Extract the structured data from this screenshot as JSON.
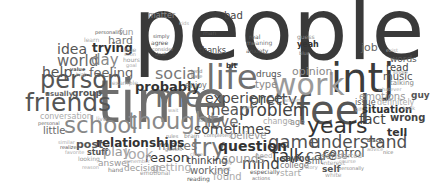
{
  "words": [
    {
      "text": "people",
      "x": 133,
      "y": -14,
      "size": 86,
      "color": "#3a3a3a",
      "weight": "normal"
    },
    {
      "text": "time",
      "x": 97,
      "y": 73,
      "size": 58,
      "color": "#6e6e6e",
      "weight": "normal"
    },
    {
      "text": "intj",
      "x": 331,
      "y": 58,
      "size": 40,
      "color": "#3c3c3c",
      "weight": "normal"
    },
    {
      "text": "feel",
      "x": 296,
      "y": 90,
      "size": 40,
      "color": "#555555",
      "weight": "normal"
    },
    {
      "text": "life",
      "x": 206,
      "y": 60,
      "size": 34,
      "color": "#707070",
      "weight": "normal"
    },
    {
      "text": "work",
      "x": 272,
      "y": 70,
      "size": 30,
      "color": "#9a9a9a",
      "weight": "normal"
    },
    {
      "text": "person",
      "x": 40,
      "y": 68,
      "size": 24,
      "color": "#555555",
      "weight": "normal"
    },
    {
      "text": "friends",
      "x": 25,
      "y": 90,
      "size": 25,
      "color": "#555555",
      "weight": "normal"
    },
    {
      "text": "school",
      "x": 64,
      "y": 114,
      "size": 23,
      "color": "#888888",
      "weight": "normal"
    },
    {
      "text": "thought",
      "x": 128,
      "y": 110,
      "size": 23,
      "color": "#8a8a8a",
      "weight": "normal"
    },
    {
      "text": "years",
      "x": 307,
      "y": 115,
      "size": 22,
      "color": "#333333",
      "weight": "normal"
    },
    {
      "text": "understand",
      "x": 310,
      "y": 134,
      "size": 17,
      "color": "#505050",
      "weight": "normal"
    },
    {
      "text": "me",
      "x": 155,
      "y": 82,
      "size": 30,
      "color": "#6e6e6e",
      "weight": "normal"
    },
    {
      "text": "game",
      "x": 268,
      "y": 133,
      "size": 18,
      "color": "#555555",
      "weight": "normal"
    },
    {
      "text": "talk",
      "x": 272,
      "y": 148,
      "size": 17,
      "color": "#333333",
      "weight": "normal"
    },
    {
      "text": "try",
      "x": 192,
      "y": 136,
      "size": 24,
      "color": "#777777",
      "weight": "normal"
    },
    {
      "text": "problem",
      "x": 239,
      "y": 102,
      "size": 17,
      "color": "#444444",
      "weight": "normal"
    },
    {
      "text": "experience",
      "x": 205,
      "y": 91,
      "size": 14,
      "color": "#4a4a4a",
      "weight": "normal"
    },
    {
      "text": "mean",
      "x": 206,
      "y": 103,
      "size": 15,
      "color": "#555555",
      "weight": "normal"
    },
    {
      "text": "pretty",
      "x": 249,
      "y": 92,
      "size": 16,
      "color": "#505050",
      "weight": "normal"
    },
    {
      "text": "love",
      "x": 207,
      "y": 115,
      "size": 15,
      "color": "#707070",
      "weight": "normal"
    },
    {
      "text": "sometimes",
      "x": 194,
      "y": 122,
      "size": 14,
      "color": "#444444",
      "weight": "normal"
    },
    {
      "text": "question",
      "x": 218,
      "y": 139,
      "size": 14,
      "color": "#333333",
      "weight": "bold"
    },
    {
      "text": "mind",
      "x": 242,
      "y": 157,
      "size": 15,
      "color": "#444444",
      "weight": "normal"
    },
    {
      "text": "sounds",
      "x": 222,
      "y": 153,
      "size": 12,
      "color": "#9a9a9a",
      "weight": "normal"
    },
    {
      "text": "fact",
      "x": 359,
      "y": 112,
      "size": 14,
      "color": "#444444",
      "weight": "normal"
    },
    {
      "text": "care",
      "x": 306,
      "y": 148,
      "size": 14,
      "color": "#555555",
      "weight": "normal"
    },
    {
      "text": "control",
      "x": 323,
      "y": 147,
      "size": 12,
      "color": "#555555",
      "weight": "normal"
    },
    {
      "text": "social",
      "x": 155,
      "y": 66,
      "size": 16,
      "color": "#777777",
      "weight": "normal"
    },
    {
      "text": "probably",
      "x": 135,
      "y": 80,
      "size": 13,
      "color": "#333333",
      "weight": "bold"
    },
    {
      "text": "reason",
      "x": 145,
      "y": 151,
      "size": 13,
      "color": "#333333",
      "weight": "normal"
    },
    {
      "text": "makes",
      "x": 158,
      "y": 140,
      "size": 12,
      "color": "#777777",
      "weight": "normal"
    },
    {
      "text": "relationships",
      "x": 96,
      "y": 137,
      "size": 12,
      "color": "#333333",
      "weight": "bold"
    },
    {
      "text": "idea",
      "x": 57,
      "y": 42,
      "size": 14,
      "color": "#555555",
      "weight": "normal"
    },
    {
      "text": "world",
      "x": 57,
      "y": 54,
      "size": 15,
      "color": "#666666",
      "weight": "normal"
    },
    {
      "text": "day",
      "x": 91,
      "y": 53,
      "size": 15,
      "color": "#888888",
      "weight": "normal"
    },
    {
      "text": "help",
      "x": 42,
      "y": 65,
      "size": 14,
      "color": "#555555",
      "weight": "normal"
    },
    {
      "text": "feeling",
      "x": 89,
      "y": 66,
      "size": 13,
      "color": "#666666",
      "weight": "normal"
    },
    {
      "text": "trying",
      "x": 92,
      "y": 42,
      "size": 12,
      "color": "#333333",
      "weight": "bold"
    },
    {
      "text": "hard",
      "x": 108,
      "y": 35,
      "size": 11,
      "color": "#777777",
      "weight": "normal"
    },
    {
      "text": "fun",
      "x": 119,
      "y": 28,
      "size": 9,
      "color": "#999999",
      "weight": "normal"
    },
    {
      "text": "personality",
      "x": 95,
      "y": 30,
      "size": 5,
      "color": "#555555",
      "weight": "normal"
    },
    {
      "text": "learn",
      "x": 84,
      "y": 37,
      "size": 6,
      "color": "#aaaaaa",
      "weight": "normal"
    },
    {
      "text": "true",
      "x": 124,
      "y": 47,
      "size": 6,
      "color": "#999999",
      "weight": "normal"
    },
    {
      "text": "hours",
      "x": 123,
      "y": 57,
      "size": 6,
      "color": "#999999",
      "weight": "normal"
    },
    {
      "text": "soon",
      "x": 124,
      "y": 52,
      "size": 5,
      "color": "#aaaaaa",
      "weight": "normal"
    },
    {
      "text": "goal",
      "x": 126,
      "y": 63,
      "size": 5,
      "color": "#aaaaaa",
      "weight": "normal"
    },
    {
      "text": "value",
      "x": 70,
      "y": 67,
      "size": 5,
      "color": "#555555",
      "weight": "bold"
    },
    {
      "text": "high",
      "x": 76,
      "y": 72,
      "size": 5,
      "color": "#aaaaaa",
      "weight": "normal"
    },
    {
      "text": "example",
      "x": 112,
      "y": 80,
      "size": 6,
      "color": "#aaaaaa",
      "weight": "normal"
    },
    {
      "text": "usually",
      "x": 45,
      "y": 91,
      "size": 7,
      "color": "#666666",
      "weight": "bold"
    },
    {
      "text": "group",
      "x": 72,
      "y": 89,
      "size": 9,
      "color": "#555555",
      "weight": "bold"
    },
    {
      "text": "conversation",
      "x": 40,
      "y": 113,
      "size": 8,
      "color": "#aaaaaa",
      "weight": "normal"
    },
    {
      "text": "live",
      "x": 96,
      "y": 116,
      "size": 6,
      "color": "#aaaaaa",
      "weight": "normal"
    },
    {
      "text": "personal",
      "x": 38,
      "y": 121,
      "size": 5,
      "color": "#666666",
      "weight": "normal"
    },
    {
      "text": "little",
      "x": 43,
      "y": 126,
      "size": 10,
      "color": "#666666",
      "weight": "normal"
    },
    {
      "text": "post",
      "x": 76,
      "y": 139,
      "size": 11,
      "color": "#555555",
      "weight": "bold"
    },
    {
      "text": "similar",
      "x": 58,
      "y": 140,
      "size": 5,
      "color": "#aaaaaa",
      "weight": "normal"
    },
    {
      "text": "realize",
      "x": 60,
      "y": 145,
      "size": 5,
      "color": "#555555",
      "weight": "normal"
    },
    {
      "text": "favorite",
      "x": 65,
      "y": 150,
      "size": 5,
      "color": "#aaaaaa",
      "weight": "normal"
    },
    {
      "text": "stuff",
      "x": 87,
      "y": 149,
      "size": 8,
      "color": "#555555",
      "weight": "bold"
    },
    {
      "text": "play",
      "x": 103,
      "y": 145,
      "size": 13,
      "color": "#999999",
      "weight": "normal"
    },
    {
      "text": "look",
      "x": 124,
      "y": 147,
      "size": 14,
      "color": "#aaaaaa",
      "weight": "normal"
    },
    {
      "text": "looking",
      "x": 78,
      "y": 156,
      "size": 6,
      "color": "#999999",
      "weight": "normal"
    },
    {
      "text": "answer",
      "x": 98,
      "y": 159,
      "size": 9,
      "color": "#999999",
      "weight": "normal"
    },
    {
      "text": "reason",
      "x": 82,
      "y": 165,
      "size": 5,
      "color": "#aaaaaa",
      "weight": "normal"
    },
    {
      "text": "hand",
      "x": 108,
      "y": 167,
      "size": 6,
      "color": "#777777",
      "weight": "normal"
    },
    {
      "text": "decision",
      "x": 124,
      "y": 164,
      "size": 9,
      "color": "#999999",
      "weight": "normal"
    },
    {
      "text": "remember",
      "x": 124,
      "y": 159,
      "size": 5,
      "color": "#aaaaaa",
      "weight": "normal"
    },
    {
      "text": "emotional",
      "x": 140,
      "y": 170,
      "size": 6,
      "color": "#999999",
      "weight": "normal"
    },
    {
      "text": "getting",
      "x": 152,
      "y": 162,
      "size": 11,
      "color": "#aaaaaa",
      "weight": "normal"
    },
    {
      "text": "thinking",
      "x": 187,
      "y": 156,
      "size": 10,
      "color": "#444444",
      "weight": "normal"
    },
    {
      "text": "working",
      "x": 190,
      "y": 166,
      "size": 10,
      "color": "#666666",
      "weight": "normal"
    },
    {
      "text": "reading",
      "x": 187,
      "y": 176,
      "size": 6,
      "color": "#555555",
      "weight": "normal"
    },
    {
      "text": "found",
      "x": 213,
      "y": 172,
      "size": 10,
      "color": "#aaaaaa",
      "weight": "normal"
    },
    {
      "text": "believe",
      "x": 230,
      "y": 131,
      "size": 10,
      "color": "#999999",
      "weight": "normal"
    },
    {
      "text": "completely",
      "x": 204,
      "y": 133,
      "size": 5,
      "color": "#888888",
      "weight": "normal"
    },
    {
      "text": "brain",
      "x": 184,
      "y": 133,
      "size": 6,
      "color": "#888888",
      "weight": "normal"
    },
    {
      "text": "rules",
      "x": 166,
      "y": 134,
      "size": 5,
      "color": "#888888",
      "weight": "normal"
    },
    {
      "text": "games",
      "x": 165,
      "y": 147,
      "size": 5,
      "color": "#888888",
      "weight": "normal"
    },
    {
      "text": "close",
      "x": 190,
      "y": 152,
      "size": 5,
      "color": "#aaaaaa",
      "weight": "normal"
    },
    {
      "text": "reply",
      "x": 220,
      "y": 160,
      "size": 5,
      "color": "#888888",
      "weight": "normal"
    },
    {
      "text": "sort",
      "x": 219,
      "y": 166,
      "size": 6,
      "color": "#aaaaaa",
      "weight": "normal"
    },
    {
      "text": "need",
      "x": 255,
      "y": 153,
      "size": 7,
      "color": "#aaaaaa",
      "weight": "normal"
    },
    {
      "text": "especially",
      "x": 250,
      "y": 169,
      "size": 6,
      "color": "#555555",
      "weight": "normal"
    },
    {
      "text": "actions",
      "x": 252,
      "y": 176,
      "size": 5,
      "color": "#777777",
      "weight": "normal"
    },
    {
      "text": "start",
      "x": 280,
      "y": 169,
      "size": 9,
      "color": "#aaaaaa",
      "weight": "normal"
    },
    {
      "text": "saying",
      "x": 281,
      "y": 155,
      "size": 8,
      "color": "#555555",
      "weight": "bold"
    },
    {
      "text": "college",
      "x": 280,
      "y": 162,
      "size": 8,
      "color": "#777777",
      "weight": "normal"
    },
    {
      "text": "shit",
      "x": 307,
      "y": 157,
      "size": 9,
      "color": "#666666",
      "weight": "normal"
    },
    {
      "text": "sense",
      "x": 321,
      "y": 152,
      "size": 9,
      "color": "#888888",
      "weight": "normal"
    },
    {
      "text": "started",
      "x": 337,
      "y": 153,
      "size": 7,
      "color": "#aaaaaa",
      "weight": "normal"
    },
    {
      "text": "interest",
      "x": 322,
      "y": 160,
      "size": 6,
      "color": "#aaaaaa",
      "weight": "normal"
    },
    {
      "text": "course",
      "x": 339,
      "y": 159,
      "size": 5,
      "color": "#aaaaaa",
      "weight": "normal"
    },
    {
      "text": "story",
      "x": 305,
      "y": 165,
      "size": 5,
      "color": "#aaaaaa",
      "weight": "normal"
    },
    {
      "text": "self",
      "x": 322,
      "y": 165,
      "size": 9,
      "color": "#555555",
      "weight": "bold"
    },
    {
      "text": "personally",
      "x": 338,
      "y": 166,
      "size": 5,
      "color": "#888888",
      "weight": "normal"
    },
    {
      "text": "white",
      "x": 325,
      "y": 172,
      "size": 6,
      "color": "#aaaaaa",
      "weight": "normal"
    },
    {
      "text": "black",
      "x": 367,
      "y": 138,
      "size": 5,
      "color": "#555555",
      "weight": "bold"
    },
    {
      "text": "advice",
      "x": 367,
      "y": 147,
      "size": 5,
      "color": "#aaaaaa",
      "weight": "normal"
    },
    {
      "text": "nice",
      "x": 383,
      "y": 150,
      "size": 5,
      "color": "#777777",
      "weight": "normal"
    },
    {
      "text": "tell",
      "x": 387,
      "y": 127,
      "size": 11,
      "color": "#333333",
      "weight": "bold"
    },
    {
      "text": "wrong",
      "x": 390,
      "y": 113,
      "size": 10,
      "color": "#444444",
      "weight": "bold"
    },
    {
      "text": "situation",
      "x": 362,
      "y": 105,
      "size": 10,
      "color": "#333333",
      "weight": "bold"
    },
    {
      "text": "gift",
      "x": 355,
      "y": 107,
      "size": 5,
      "color": "#aaaaaa",
      "weight": "normal"
    },
    {
      "text": "book",
      "x": 403,
      "y": 106,
      "size": 5,
      "color": "#aaaaaa",
      "weight": "normal"
    },
    {
      "text": "issue",
      "x": 355,
      "y": 99,
      "size": 8,
      "color": "#555555",
      "weight": "normal"
    },
    {
      "text": "definitely",
      "x": 377,
      "y": 99,
      "size": 8,
      "color": "#aaaaaa",
      "weight": "normal"
    },
    {
      "text": "emotions",
      "x": 359,
      "y": 92,
      "size": 10,
      "color": "#999999",
      "weight": "normal"
    },
    {
      "text": "guy",
      "x": 411,
      "y": 91,
      "size": 9,
      "color": "#555555",
      "weight": "bold"
    },
    {
      "text": "whatever",
      "x": 378,
      "y": 87,
      "size": 5,
      "color": "#aaaaaa",
      "weight": "normal"
    },
    {
      "text": "talking",
      "x": 390,
      "y": 80,
      "size": 7,
      "color": "#888888",
      "weight": "normal"
    },
    {
      "text": "music",
      "x": 383,
      "y": 72,
      "size": 10,
      "color": "#555555",
      "weight": "normal"
    },
    {
      "text": "single",
      "x": 393,
      "y": 70,
      "size": 5,
      "color": "#888888",
      "weight": "normal"
    },
    {
      "text": "read",
      "x": 386,
      "y": 63,
      "size": 10,
      "color": "#444444",
      "weight": "normal"
    },
    {
      "text": "words",
      "x": 390,
      "y": 55,
      "size": 9,
      "color": "#555555",
      "weight": "normal"
    },
    {
      "text": "exist",
      "x": 386,
      "y": 48,
      "size": 5,
      "color": "#aaaaaa",
      "weight": "normal"
    },
    {
      "text": "job",
      "x": 361,
      "y": 42,
      "size": 11,
      "color": "#666666",
      "weight": "normal"
    },
    {
      "text": "opinion",
      "x": 292,
      "y": 66,
      "size": 11,
      "color": "#888888",
      "weight": "normal"
    },
    {
      "text": "guess",
      "x": 297,
      "y": 34,
      "size": 6,
      "color": "#888888",
      "weight": "normal"
    },
    {
      "text": "yeah",
      "x": 297,
      "y": 41,
      "size": 8,
      "color": "#333333",
      "weight": "bold"
    },
    {
      "text": "blue",
      "x": 299,
      "y": 51,
      "size": 5,
      "color": "#888888",
      "weight": "normal"
    },
    {
      "text": "bad",
      "x": 224,
      "y": 11,
      "size": 10,
      "color": "#444444",
      "weight": "normal"
    },
    {
      "text": "matter",
      "x": 148,
      "y": 12,
      "size": 8,
      "color": "#888888",
      "weight": "normal"
    },
    {
      "text": "kids",
      "x": 179,
      "y": 21,
      "size": 5,
      "color": "#aaaaaa",
      "weight": "normal"
    },
    {
      "text": "man",
      "x": 203,
      "y": 30,
      "size": 6,
      "color": "#555555",
      "weight": "normal"
    },
    {
      "text": "thanks",
      "x": 199,
      "y": 47,
      "size": 8,
      "color": "#444444",
      "weight": "normal"
    },
    {
      "text": "simply",
      "x": 153,
      "y": 34,
      "size": 5,
      "color": "#555555",
      "weight": "normal"
    },
    {
      "text": "agree",
      "x": 151,
      "y": 40,
      "size": 6,
      "color": "#555555",
      "weight": "normal"
    },
    {
      "text": "consider",
      "x": 152,
      "y": 47,
      "size": 5,
      "color": "#888888",
      "weight": "normal"
    },
    {
      "text": "deal",
      "x": 155,
      "y": 52,
      "size": 5,
      "color": "#555555",
      "weight": "normal"
    },
    {
      "text": "real",
      "x": 249,
      "y": 34,
      "size": 6,
      "color": "#555555",
      "weight": "normal"
    },
    {
      "text": "meaning",
      "x": 246,
      "y": 40,
      "size": 6,
      "color": "#777777",
      "weight": "normal"
    },
    {
      "text": "anxiety",
      "x": 246,
      "y": 48,
      "size": 6,
      "color": "#555555",
      "weight": "normal"
    },
    {
      "text": "bit",
      "x": 226,
      "y": 63,
      "size": 7,
      "color": "#333333",
      "weight": "bold"
    },
    {
      "text": "drugs",
      "x": 256,
      "y": 70,
      "size": 9,
      "color": "#555555",
      "weight": "normal"
    },
    {
      "text": "type",
      "x": 255,
      "y": 80,
      "size": 10,
      "color": "#888888",
      "weight": "normal"
    },
    {
      "text": "enjoy",
      "x": 185,
      "y": 82,
      "size": 8,
      "color": "#777777",
      "weight": "normal"
    },
    {
      "text": "tend",
      "x": 191,
      "y": 69,
      "size": 5,
      "color": "#777777",
      "weight": "normal"
    },
    {
      "text": "hate",
      "x": 191,
      "y": 74,
      "size": 5,
      "color": "#888888",
      "weight": "normal"
    },
    {
      "text": "random",
      "x": 282,
      "y": 98,
      "size": 5,
      "color": "#aaaaaa",
      "weight": "normal"
    },
    {
      "text": "past",
      "x": 243,
      "y": 105,
      "size": 5,
      "color": "#aaaaaa",
      "weight": "normal"
    },
    {
      "text": "change",
      "x": 263,
      "y": 118,
      "size": 8,
      "color": "#aaaaaa",
      "weight": "normal"
    },
    {
      "text": "age",
      "x": 290,
      "y": 119,
      "size": 8,
      "color": "#888888",
      "weight": "normal"
    },
    {
      "text": "song",
      "x": 198,
      "y": 118,
      "size": 5,
      "color": "#888888",
      "weight": "normal"
    },
    {
      "text": "wait",
      "x": 168,
      "y": 108,
      "size": 5,
      "color": "#aaaaaa",
      "weight": "normal"
    }
  ]
}
